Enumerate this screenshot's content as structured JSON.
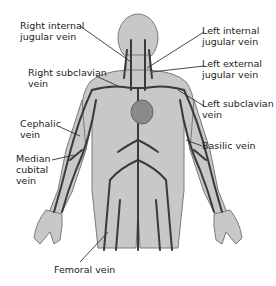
{
  "caption_fragment": "(partially cut-off caption text)",
  "figure": {
    "colors": {
      "body_fill": "#c8c8c8",
      "body_outline": "#7a7a7a",
      "vein": "#3a3a3a",
      "heart": "#8a8a8a",
      "leader_line": "#333333",
      "label_text": "#222222"
    }
  },
  "labels": {
    "right_internal_jugular": {
      "line1": "Right internal",
      "line2": "jugular vein"
    },
    "left_internal_jugular": {
      "line1": "Left internal",
      "line2": "jugular vein"
    },
    "left_external_jugular": {
      "line1": "Left external",
      "line2": "jugular vein"
    },
    "right_subclavian": {
      "line1": "Right subclavian",
      "line2": "vein"
    },
    "left_subclavian": {
      "line1": "Left subclavian",
      "line2": "vein"
    },
    "cephalic": {
      "line1": "Cephalic",
      "line2": "vein"
    },
    "basilic": {
      "line1": "Basilic vein"
    },
    "median_cubital": {
      "line1": "Median",
      "line2": "cubital",
      "line3": "vein"
    },
    "femoral": {
      "line1": "Femoral vein"
    }
  }
}
